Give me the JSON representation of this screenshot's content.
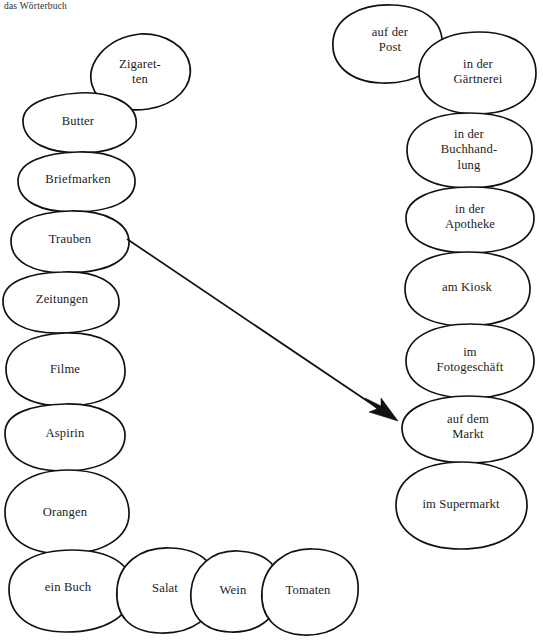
{
  "header": {
    "label": "das Wörterbuch"
  },
  "colors": {
    "background": "#ffffff",
    "stroke": "#111111",
    "text": "#1c1c1c"
  },
  "diagram": {
    "type": "vocabulary-matching-worksheet",
    "title": "das Wörterbuch",
    "left_column_heading": "",
    "right_column_heading": "",
    "items": [
      {
        "id": "zigaretten",
        "label": "Zigaret-\nten",
        "group": "goods",
        "cx": 140,
        "cy": 72
      },
      {
        "id": "butter",
        "label": "Butter",
        "group": "goods",
        "cx": 78,
        "cy": 122
      },
      {
        "id": "briefmarken",
        "label": "Briefmarken",
        "group": "goods",
        "cx": 78,
        "cy": 180
      },
      {
        "id": "trauben",
        "label": "Trauben",
        "group": "goods",
        "cx": 70,
        "cy": 240
      },
      {
        "id": "zeitungen",
        "label": "Zeitungen",
        "group": "goods",
        "cx": 62,
        "cy": 300
      },
      {
        "id": "filme",
        "label": "Filme",
        "group": "goods",
        "cx": 65,
        "cy": 370
      },
      {
        "id": "aspirin",
        "label": "Aspirin",
        "group": "goods",
        "cx": 65,
        "cy": 434
      },
      {
        "id": "orangen",
        "label": "Orangen",
        "group": "goods",
        "cx": 65,
        "cy": 513
      },
      {
        "id": "ein-buch",
        "label": "ein Buch",
        "group": "goods",
        "cx": 68,
        "cy": 588
      },
      {
        "id": "salat",
        "label": "Salat",
        "group": "goods",
        "cx": 165,
        "cy": 589
      },
      {
        "id": "wein",
        "label": "Wein",
        "group": "goods",
        "cx": 233,
        "cy": 591
      },
      {
        "id": "tomaten",
        "label": "Tomaten",
        "group": "goods",
        "cx": 308,
        "cy": 591
      },
      {
        "id": "auf-der-post",
        "label": "auf der\nPost",
        "group": "places",
        "cx": 390,
        "cy": 40
      },
      {
        "id": "in-der-gaertnerei",
        "label": "in der\nGärtnerei",
        "group": "places",
        "cx": 478,
        "cy": 72
      },
      {
        "id": "in-der-buchhandlung",
        "label": "in der Buchhand-\nlung",
        "group": "places",
        "cx": 469,
        "cy": 150
      },
      {
        "id": "in-der-apotheke",
        "label": "in der Apotheke",
        "group": "places",
        "cx": 470,
        "cy": 217
      },
      {
        "id": "am-kiosk",
        "label": "am Kiosk",
        "group": "places",
        "cx": 467,
        "cy": 288
      },
      {
        "id": "im-fotogeschaeft",
        "label": "im Fotogeschäft",
        "group": "places",
        "cx": 470,
        "cy": 360
      },
      {
        "id": "auf-dem-markt",
        "label": "auf dem Markt",
        "group": "places",
        "cx": 468,
        "cy": 427
      },
      {
        "id": "im-supermarkt",
        "label": "im Supermarkt",
        "group": "places",
        "cx": 461,
        "cy": 505
      }
    ],
    "connections": [
      {
        "id": "trauben-to-markt",
        "from": "trauben",
        "to": "auf-dem-markt",
        "arrow": true
      }
    ]
  }
}
